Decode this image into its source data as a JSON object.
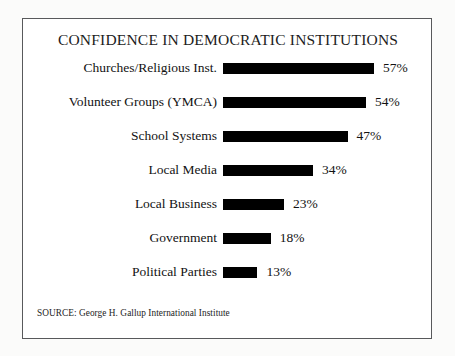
{
  "chart_data": {
    "type": "bar",
    "title": "CONFIDENCE IN DEMOCRATIC INSTITUTIONS",
    "orientation": "horizontal",
    "xlabel": "",
    "ylabel": "",
    "xlim": [
      0,
      60
    ],
    "grid": false,
    "legend": "none",
    "value_suffix": "%",
    "categories": [
      "Churches/Religious Inst.",
      "Volunteer Groups (YMCA)",
      "School Systems",
      "Local Media",
      "Local Business",
      "Government",
      "Political Parties"
    ],
    "values": [
      57,
      54,
      47,
      34,
      23,
      18,
      13
    ],
    "value_labels": [
      "57%",
      "54%",
      "47%",
      "34%",
      "23%",
      "18%",
      "13%"
    ],
    "bar_color": "#000000",
    "rows": [
      {
        "label": "Churches/Religious Inst.",
        "value": 57,
        "value_label": "57%"
      },
      {
        "label": "Volunteer Groups (YMCA)",
        "value": 54,
        "value_label": "54%"
      },
      {
        "label": "School Systems",
        "value": 47,
        "value_label": "47%"
      },
      {
        "label": "Local Media",
        "value": 34,
        "value_label": "34%"
      },
      {
        "label": "Local Business",
        "value": 23,
        "value_label": "23%"
      },
      {
        "label": "Government",
        "value": 18,
        "value_label": "18%"
      },
      {
        "label": "Political Parties",
        "value": 13,
        "value_label": "13%"
      }
    ],
    "annotations": [
      "SOURCE: George H. Gallup International Institute"
    ]
  },
  "source": {
    "text": "SOURCE: George H. Gallup International Institute"
  },
  "style": {
    "frame_border_color": "#58595b",
    "page_background": "#fbfbfa",
    "chart_background": "#ffffff",
    "text_color": "#121212",
    "px_per_percent": 2.65
  }
}
